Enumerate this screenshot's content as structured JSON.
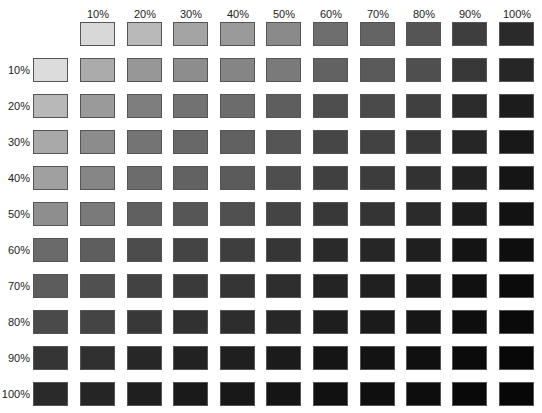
{
  "column_labels": [
    "10%",
    "20%",
    "30%",
    "40%",
    "50%",
    "60%",
    "70%",
    "80%",
    "90%",
    "100%"
  ],
  "row_labels": [
    "10%",
    "20%",
    "30%",
    "40%",
    "50%",
    "60%",
    "70%",
    "80%",
    "90%",
    "100%"
  ],
  "header_row_colors": [
    "#d8d8d8",
    "#b9b9b9",
    "#a4a4a4",
    "#9a9a9a",
    "#8a8a8a",
    "#6e6e6e",
    "#646464",
    "#555555",
    "#3e3e3e",
    "#2a2a2a"
  ],
  "header_col_colors": [
    "#dcdcdc",
    "#b8b8b8",
    "#a9a9a9",
    "#a0a0a0",
    "#8e8e8e",
    "#6a6a6a",
    "#5c5c5c",
    "#4a4a4a",
    "#353535",
    "#2a2a2a"
  ],
  "grid_colors": [
    [
      "#ababab",
      "#979797",
      "#8d8d8d",
      "#858585",
      "#7a7a7a",
      "#626262",
      "#5a5a5a",
      "#4f4f4f",
      "#383838",
      "#262626"
    ],
    [
      "#9a9a9a",
      "#7e7e7e",
      "#727272",
      "#6c6c6c",
      "#5e5e5e",
      "#4e4e4e",
      "#4a4a4a",
      "#404040",
      "#2c2c2c",
      "#1c1c1c"
    ],
    [
      "#8c8c8c",
      "#747474",
      "#686868",
      "#616161",
      "#555555",
      "#464646",
      "#424242",
      "#383838",
      "#262626",
      "#181818"
    ],
    [
      "#868686",
      "#6c6c6c",
      "#626262",
      "#5b5b5b",
      "#4e4e4e",
      "#404040",
      "#3c3c3c",
      "#323232",
      "#222222",
      "#151515"
    ],
    [
      "#7a7a7a",
      "#606060",
      "#565656",
      "#505050",
      "#444444",
      "#383838",
      "#343434",
      "#2b2b2b",
      "#1c1c1c",
      "#121212"
    ],
    [
      "#5e5e5e",
      "#4c4c4c",
      "#444444",
      "#3e3e3e",
      "#363636",
      "#2a2a2a",
      "#262626",
      "#1f1f1f",
      "#141414",
      "#0e0e0e"
    ],
    [
      "#505050",
      "#424242",
      "#3a3a3a",
      "#353535",
      "#2e2e2e",
      "#242424",
      "#202020",
      "#1a1a1a",
      "#111111",
      "#0b0b0b"
    ],
    [
      "#444444",
      "#383838",
      "#313131",
      "#2d2d2d",
      "#272727",
      "#1e1e1e",
      "#1b1b1b",
      "#161616",
      "#0e0e0e",
      "#0a0a0a"
    ],
    [
      "#303030",
      "#272727",
      "#222222",
      "#1f1f1f",
      "#1b1b1b",
      "#151515",
      "#131313",
      "#101010",
      "#0b0b0b",
      "#080808"
    ],
    [
      "#252525",
      "#1f1f1f",
      "#1a1a1a",
      "#181818",
      "#151515",
      "#111111",
      "#0f0f0f",
      "#0d0d0d",
      "#090909",
      "#070707"
    ]
  ]
}
